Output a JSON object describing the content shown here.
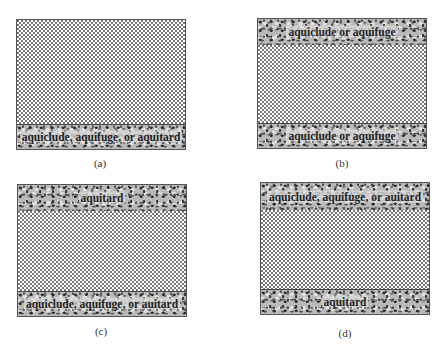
{
  "panels": {
    "a": {
      "caption": "(a)",
      "top_layer": null,
      "bottom_layer": "aquiclude, aquifuge, or aquitard"
    },
    "b": {
      "caption": "(b)",
      "top_layer": "aquiclude or aquifuge",
      "bottom_layer": "aquiclude or aquifuge"
    },
    "c": {
      "caption": "(c)",
      "top_layer": "aquitard",
      "bottom_layer": "aquiclude, aquifuge, or auitard"
    },
    "d": {
      "caption": "(d)",
      "top_layer": "aquiclude, aquifuge, or auitard",
      "bottom_layer": "aquitard"
    }
  },
  "legend": {
    "aquifer_pattern": "sand (dotted)",
    "confining_pattern": "gravel (mottled)"
  }
}
